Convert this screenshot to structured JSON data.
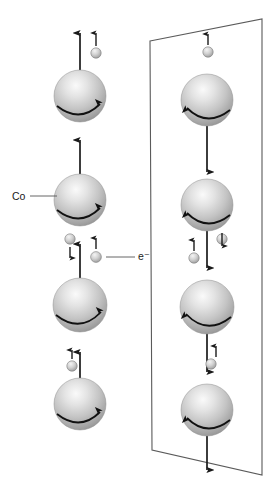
{
  "figure": {
    "background_color": "#ffffff",
    "line_color": "#1a1a1a",
    "frame_color": "#555555",
    "sphere_fill_light": "#f2f2f2",
    "sphere_fill_mid": "#bdbdbd",
    "sphere_fill_dark": "#8a8a8a",
    "electron_fill_light": "#ededed",
    "electron_fill_dark": "#9a9a9a"
  },
  "labels": {
    "cobalt": "Co",
    "electron": "e⁻"
  },
  "left_column": {
    "name": "free-cobalt-column",
    "magnetization_direction": "up",
    "rotation_sense": "clockwise",
    "spheres": [
      {
        "id": 1,
        "cx": 80,
        "cy": 96,
        "r": 26
      },
      {
        "id": 2,
        "cx": 80,
        "cy": 200,
        "r": 26
      },
      {
        "id": 3,
        "cx": 80,
        "cy": 305,
        "r": 27
      },
      {
        "id": 4,
        "cx": 80,
        "cy": 404,
        "r": 26
      }
    ]
  },
  "right_column": {
    "name": "framed-cobalt-column",
    "magnetization_direction": "down",
    "rotation_sense": "counter-clockwise",
    "spheres": [
      {
        "id": 1,
        "cx": 207,
        "cy": 100,
        "r": 26
      },
      {
        "id": 2,
        "cx": 207,
        "cy": 205,
        "r": 26
      },
      {
        "id": 3,
        "cx": 207,
        "cy": 307,
        "r": 27
      },
      {
        "id": 4,
        "cx": 207,
        "cy": 410,
        "r": 26
      }
    ]
  },
  "frame": {
    "name": "slab-parallelogram",
    "points": "150,41 262,19 262,475 152,450"
  },
  "electrons": [
    {
      "id": "e1",
      "cx": 96,
      "cy": 47,
      "spin": "up",
      "column": "left"
    },
    {
      "id": "e2",
      "cx": 70,
      "cy": 239,
      "spin": "down",
      "column": "left"
    },
    {
      "id": "e3",
      "cx": 96,
      "cy": 257,
      "spin": "up",
      "column": "left",
      "labeled": true
    },
    {
      "id": "e4",
      "cx": 72,
      "cy": 366,
      "spin": "up",
      "column": "left"
    },
    {
      "id": "e5",
      "cx": 208,
      "cy": 52,
      "spin": "up",
      "column": "right"
    },
    {
      "id": "e6",
      "cx": 222,
      "cy": 239,
      "spin": "down",
      "column": "right"
    },
    {
      "id": "e7",
      "cx": 194,
      "cy": 258,
      "spin": "up",
      "column": "right"
    },
    {
      "id": "e8",
      "cx": 213,
      "cy": 364,
      "spin": "up",
      "column": "right"
    }
  ],
  "arrows": {
    "long_up_left": [
      {
        "x": 80,
        "y1": 70,
        "y2": 33
      },
      {
        "x": 80,
        "y1": 174,
        "y2": 140
      },
      {
        "x": 80,
        "y1": 278,
        "y2": 244
      },
      {
        "x": 80,
        "y1": 378,
        "y2": 352
      }
    ],
    "long_down_right": [
      {
        "x": 207,
        "y1": 126,
        "y2": 172
      },
      {
        "x": 207,
        "y1": 231,
        "y2": 268
      },
      {
        "x": 207,
        "y1": 333,
        "y2": 372
      },
      {
        "x": 207,
        "y1": 436,
        "y2": 470
      }
    ]
  },
  "leaders": {
    "cobalt_line": {
      "x1": 30,
      "y1": 196,
      "x2": 57,
      "y2": 196
    },
    "electron_line": {
      "x1": 106,
      "y1": 257,
      "x2": 135,
      "y2": 257
    }
  }
}
